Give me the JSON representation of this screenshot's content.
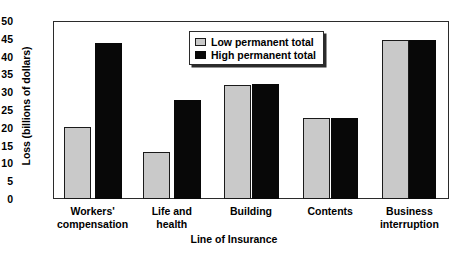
{
  "chart_data": {
    "type": "bar",
    "title": "",
    "xlabel": "Line of Insurance",
    "ylabel": "Loss (billions of dollars)",
    "categories": [
      "Workers'\ncompensation",
      "Life and\nhealth",
      "Building",
      "Contents",
      "Business\ninterruption"
    ],
    "series": [
      {
        "name": "Low permanent total",
        "color": "#c9c9c9",
        "values": [
          20.3,
          13.2,
          32.0,
          22.8,
          44.7
        ]
      },
      {
        "name": "High permanent total",
        "color": "#080808",
        "values": [
          43.8,
          27.8,
          32.2,
          22.8,
          44.7
        ]
      }
    ],
    "ylim": [
      0,
      50
    ],
    "yticks": [
      0,
      5,
      10,
      15,
      20,
      25,
      30,
      35,
      40,
      45,
      50
    ],
    "ytick_labels": [
      "0",
      "5",
      "10",
      "15",
      "20",
      "25",
      "30",
      "35",
      "40",
      "45",
      "50"
    ],
    "grid": false,
    "legend_position": "upper center"
  },
  "legend": {
    "items": [
      {
        "label": "Low permanent total",
        "swatch": "low"
      },
      {
        "label": "High permanent total",
        "swatch": "high"
      }
    ]
  }
}
